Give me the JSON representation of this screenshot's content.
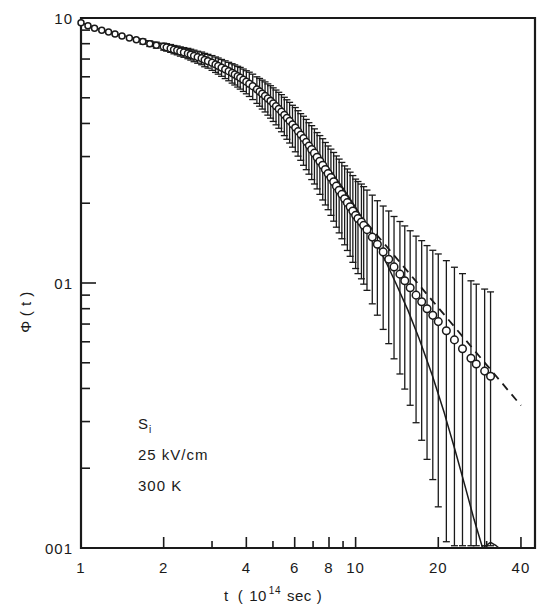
{
  "chart_data": {
    "type": "scatter",
    "title": "",
    "xlabel": "t ( 10^14 sec )",
    "xlabel_parts": {
      "var": "t",
      "open": "(",
      "mantissa": "10",
      "exponent": "14",
      "unit": "sec",
      "close": ")"
    },
    "ylabel": "Φ ( t )",
    "ylabel_parts": {
      "symbol": "Φ",
      "arg": "( t )"
    },
    "xscale": "log",
    "yscale": "log",
    "xlim": [
      1,
      45
    ],
    "ylim": [
      0.01,
      1.0
    ],
    "grid": false,
    "legend": false,
    "x_ticklabels": [
      "1",
      "2",
      "4",
      "6",
      "8",
      "10",
      "20",
      "40"
    ],
    "x_tickvalues": [
      1,
      2,
      4,
      6,
      8,
      10,
      20,
      40
    ],
    "x_minor_ticks": [
      2,
      3,
      4,
      5,
      6,
      7,
      8,
      9,
      10,
      20,
      30,
      40
    ],
    "y_ticklabels": [
      "10",
      "01",
      "001"
    ],
    "y_tickvalues": [
      1.0,
      0.1,
      0.01
    ],
    "y_minor_ticks": [
      0.9,
      0.8,
      0.7,
      0.6,
      0.5,
      0.4,
      0.3,
      0.2,
      0.1,
      0.09,
      0.08,
      0.07,
      0.06,
      0.05,
      0.04,
      0.03,
      0.02,
      0.01
    ],
    "annotations": [
      "Si",
      "25 kV/cm",
      "300 K"
    ],
    "annotation_lines": [
      {
        "text": "Si",
        "subscript": "i",
        "base": "S"
      },
      {
        "text": "25 kV/cm"
      },
      {
        "text": "300 K"
      }
    ],
    "series": [
      {
        "name": "experimental data",
        "marker": "open-circle",
        "style": "points-with-errorbars",
        "x": [
          1.0,
          1.06,
          1.12,
          1.19,
          1.26,
          1.33,
          1.41,
          1.5,
          1.59,
          1.68,
          1.78,
          1.88,
          2.0,
          2.05,
          2.12,
          2.18,
          2.24,
          2.3,
          2.37,
          2.45,
          2.51,
          2.58,
          2.66,
          2.75,
          2.82,
          2.9,
          3.0,
          3.09,
          3.16,
          3.25,
          3.35,
          3.45,
          3.55,
          3.63,
          3.72,
          3.8,
          3.9,
          4.0,
          4.1,
          4.22,
          4.37,
          4.47,
          4.57,
          4.68,
          4.79,
          4.9,
          5.01,
          5.13,
          5.25,
          5.37,
          5.5,
          5.62,
          5.75,
          5.89,
          6.03,
          6.17,
          6.31,
          6.46,
          6.61,
          6.76,
          6.92,
          7.08,
          7.24,
          7.41,
          7.59,
          7.76,
          7.94,
          8.13,
          8.32,
          8.51,
          8.71,
          8.91,
          9.12,
          9.33,
          9.55,
          9.77,
          10.0,
          10.2,
          10.5,
          10.7,
          11.0,
          11.5,
          12.0,
          12.6,
          13.2,
          13.8,
          14.5,
          15.1,
          15.8,
          16.6,
          17.4,
          18.2,
          19.1,
          20.0,
          21.4,
          22.9,
          24.5,
          26.3,
          27.5,
          29.5,
          31.0
        ],
        "y": [
          0.96,
          0.935,
          0.915,
          0.9,
          0.885,
          0.87,
          0.855,
          0.84,
          0.828,
          0.815,
          0.8,
          0.79,
          0.78,
          0.775,
          0.768,
          0.76,
          0.755,
          0.748,
          0.742,
          0.735,
          0.728,
          0.72,
          0.712,
          0.705,
          0.695,
          0.688,
          0.678,
          0.668,
          0.66,
          0.65,
          0.64,
          0.63,
          0.62,
          0.612,
          0.603,
          0.595,
          0.585,
          0.575,
          0.565,
          0.553,
          0.538,
          0.528,
          0.518,
          0.508,
          0.497,
          0.487,
          0.476,
          0.465,
          0.454,
          0.443,
          0.431,
          0.42,
          0.409,
          0.397,
          0.386,
          0.374,
          0.363,
          0.352,
          0.341,
          0.33,
          0.319,
          0.309,
          0.298,
          0.288,
          0.278,
          0.268,
          0.259,
          0.25,
          0.241,
          0.232,
          0.224,
          0.216,
          0.208,
          0.201,
          0.194,
          0.187,
          0.18,
          0.175,
          0.17,
          0.165,
          0.159,
          0.149,
          0.14,
          0.131,
          0.123,
          0.115,
          0.108,
          0.102,
          0.096,
          0.09,
          0.085,
          0.08,
          0.0755,
          0.0715,
          0.066,
          0.061,
          0.0565,
          0.052,
          0.0495,
          0.0465,
          0.0445
        ],
        "yerr_rel": [
          0.01,
          0.01,
          0.012,
          0.013,
          0.014,
          0.015,
          0.016,
          0.018,
          0.02,
          0.022,
          0.024,
          0.026,
          0.03,
          0.032,
          0.034,
          0.036,
          0.038,
          0.04,
          0.042,
          0.045,
          0.047,
          0.05,
          0.052,
          0.055,
          0.058,
          0.06,
          0.064,
          0.067,
          0.07,
          0.073,
          0.077,
          0.08,
          0.084,
          0.087,
          0.09,
          0.094,
          0.097,
          0.1,
          0.105,
          0.11,
          0.115,
          0.12,
          0.125,
          0.13,
          0.135,
          0.14,
          0.145,
          0.15,
          0.155,
          0.16,
          0.165,
          0.17,
          0.175,
          0.18,
          0.19,
          0.195,
          0.2,
          0.21,
          0.215,
          0.22,
          0.23,
          0.235,
          0.24,
          0.25,
          0.26,
          0.265,
          0.27,
          0.28,
          0.29,
          0.3,
          0.31,
          0.32,
          0.33,
          0.34,
          0.35,
          0.36,
          0.37,
          0.38,
          0.39,
          0.4,
          0.41,
          0.44,
          0.46,
          0.49,
          0.52,
          0.55,
          0.58,
          0.61,
          0.64,
          0.67,
          0.7,
          0.73,
          0.76,
          0.8,
          0.84,
          0.88,
          0.92,
          0.96,
          1.0,
          1.04,
          1.08
        ]
      },
      {
        "name": "theoretical curve",
        "style": "solid-line",
        "x": [
          1.0,
          1.3,
          1.7,
          2.2,
          2.8,
          3.5,
          4.3,
          5.2,
          6.1,
          7.0,
          8.0,
          9.0,
          10.0,
          11.0,
          12.0,
          13.0,
          14.0,
          15.5,
          17.0,
          19.0,
          21.0,
          23.0,
          25.0,
          27.0,
          29.0,
          31.0,
          32.5,
          33.3
        ],
        "y": [
          0.96,
          0.875,
          0.825,
          0.78,
          0.72,
          0.645,
          0.56,
          0.468,
          0.39,
          0.325,
          0.27,
          0.228,
          0.193,
          0.164,
          0.139,
          0.118,
          0.1,
          0.079,
          0.062,
          0.045,
          0.0325,
          0.0235,
          0.0172,
          0.0128,
          0.01,
          0.0105,
          0.0102,
          0.01
        ]
      },
      {
        "name": "dashed extrapolation",
        "style": "dashed-line",
        "x": [
          11.0,
          40.0
        ],
        "y": [
          0.168,
          0.0345
        ]
      }
    ]
  },
  "figure": {
    "axis_color": "#1a1a1a",
    "data_color": "#1a1a1a",
    "background": "#ffffff"
  }
}
